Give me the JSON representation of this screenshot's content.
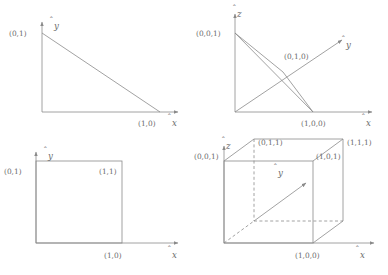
{
  "figure": {
    "line_color": "#8a8a8a",
    "text_color": "#6b6b6b",
    "background": "#ffffff"
  },
  "panels": [
    {
      "id": "top-left",
      "name": "2d-simplex",
      "caption": "2D unit simplex (triangle)",
      "axes": [
        {
          "name": "x-axis",
          "label": "x",
          "hat": true,
          "direction": "right"
        },
        {
          "name": "y-axis",
          "label": "y",
          "hat": true,
          "direction": "up"
        }
      ],
      "vertices": [
        {
          "label": "(0,1)",
          "x": 0,
          "y": 1
        },
        {
          "label": "(1,0)",
          "x": 1,
          "y": 0
        }
      ]
    },
    {
      "id": "top-right",
      "name": "3d-simplex",
      "caption": "3D unit simplex (tetrahedron face)",
      "axes": [
        {
          "name": "x-axis",
          "label": "x",
          "hat": true,
          "direction": "right"
        },
        {
          "name": "y-axis",
          "label": "y",
          "hat": true,
          "direction": "diagonal"
        },
        {
          "name": "z-axis",
          "label": "z",
          "hat": true,
          "direction": "up"
        }
      ],
      "vertices": [
        {
          "label": "(0,0,1)",
          "x": 0,
          "y": 0,
          "z": 1
        },
        {
          "label": "(0,1,0)",
          "x": 0,
          "y": 1,
          "z": 0
        },
        {
          "label": "(1,0,0)",
          "x": 1,
          "y": 0,
          "z": 0
        }
      ]
    },
    {
      "id": "bottom-left",
      "name": "2d-unit-cube",
      "caption": "2D unit cube (square)",
      "axes": [
        {
          "name": "x-axis",
          "label": "x",
          "hat": true,
          "direction": "right"
        },
        {
          "name": "y-axis",
          "label": "y",
          "hat": true,
          "direction": "up"
        }
      ],
      "vertices": [
        {
          "label": "(0,1)",
          "x": 0,
          "y": 1
        },
        {
          "label": "(1,1)",
          "x": 1,
          "y": 1
        },
        {
          "label": "(1,0)",
          "x": 1,
          "y": 0
        }
      ]
    },
    {
      "id": "bottom-right",
      "name": "3d-unit-cube",
      "caption": "3D unit cube",
      "axes": [
        {
          "name": "x-axis",
          "label": "x",
          "hat": true,
          "direction": "right"
        },
        {
          "name": "y-axis",
          "label": "y",
          "hat": true,
          "direction": "diagonal"
        },
        {
          "name": "z-axis",
          "label": "z",
          "hat": true,
          "direction": "up"
        }
      ],
      "vertices": [
        {
          "label": "(0,0,1)",
          "x": 0,
          "y": 0,
          "z": 1
        },
        {
          "label": "(0,1,1)",
          "x": 0,
          "y": 1,
          "z": 1
        },
        {
          "label": "(1,1,1)",
          "x": 1,
          "y": 1,
          "z": 1
        },
        {
          "label": "(1,0,1)",
          "x": 1,
          "y": 0,
          "z": 1
        },
        {
          "label": "(1,0,0)",
          "x": 1,
          "y": 0,
          "z": 0
        }
      ]
    }
  ],
  "labels": {
    "tl_v01": "(0,1)",
    "tl_v10": "(1,0)",
    "tl_ax_x": "x",
    "tl_ax_y": "y",
    "tr_v001": "(0,0,1)",
    "tr_v010": "(0,1,0)",
    "tr_v100": "(1,0,0)",
    "tr_ax_x": "x",
    "tr_ax_y": "y",
    "tr_ax_z": "z",
    "bl_v01": "(0,1)",
    "bl_v11": "(1,1)",
    "bl_v10": "(1,0)",
    "bl_ax_x": "x",
    "bl_ax_y": "y",
    "br_v001": "(0,0,1)",
    "br_v011": "(0,1,1)",
    "br_v111": "(1,1,1)",
    "br_v101": "(1,0,1)",
    "br_v100": "(1,0,0)",
    "br_ax_x": "x",
    "br_ax_y": "y",
    "br_ax_z": "z"
  }
}
